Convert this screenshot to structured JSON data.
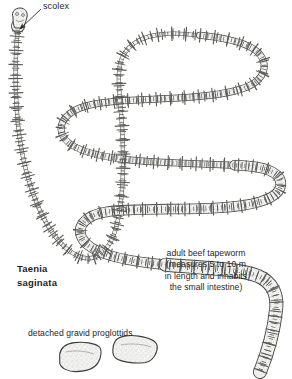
{
  "figure": {
    "title": "Taenia saginata",
    "background_color": "#ffffff",
    "ink_color": "#3a3a3a",
    "fill_color": "#f2f2f0",
    "stipple_color": "#8a8a88"
  },
  "labels": {
    "scolex": "scolex",
    "species": "Taenia\nsaginata",
    "adult": "adult beef tapeworm\n(measures 5 to 10 m\nin length and inhabits\nthe small intestine)",
    "proglottids": "detached gravid proglottids"
  },
  "annotations": {
    "leader_arrow": "arrow-pointing-to-scolex"
  },
  "parts": {
    "scolex": "scolex-head",
    "neck": "thin-neck",
    "strobila": "segmented-body",
    "detached_segments": [
      "proglottid-1",
      "proglottid-2"
    ]
  }
}
